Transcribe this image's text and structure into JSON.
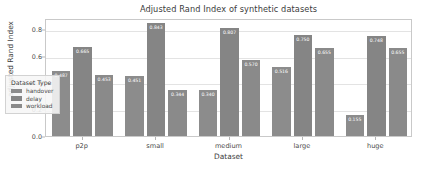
{
  "chart_data": {
    "type": "bar",
    "title": "Adjusted Rand Index of synthetic datasets",
    "xlabel": "Dataset",
    "ylabel": "adjusted Rand Index",
    "categories": [
      "p2p",
      "small",
      "medium",
      "large",
      "huge"
    ],
    "ylim": [
      0.0,
      0.88
    ],
    "yticks": [
      "0.0",
      "0.2",
      "0.4",
      "0.6",
      "0.8"
    ],
    "ytick_values": [
      0.0,
      0.2,
      0.4,
      0.6,
      0.8
    ],
    "grid": true,
    "legend_title": "Dataset Type",
    "legend_position": "lower left",
    "series": [
      {
        "name": "handover",
        "color": "#8c8c8c",
        "values": [
          0.487,
          0.451,
          0.34,
          0.516,
          0.155
        ],
        "labels": [
          "0.487",
          "0.451",
          "0.340",
          "0.516",
          "0.155"
        ]
      },
      {
        "name": "delay",
        "color": "#858585",
        "values": [
          0.665,
          0.843,
          0.807,
          0.75,
          0.748
        ],
        "labels": [
          "0.665",
          "0.843",
          "0.807",
          "0.750",
          "0.748"
        ]
      },
      {
        "name": "workload",
        "color": "#8a8a8a",
        "values": [
          0.453,
          0.344,
          0.57,
          0.655,
          0.655
        ],
        "labels": [
          "0.453",
          "0.344",
          "0.570",
          "0.655",
          "0.655"
        ]
      }
    ]
  }
}
